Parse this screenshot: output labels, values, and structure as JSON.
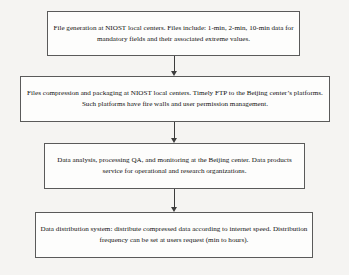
{
  "diagram": {
    "type": "flowchart",
    "orientation": "vertical",
    "colors": {
      "background": "#f5f4f2",
      "node_fill": "#fdfdfc",
      "node_border": "#5a5a5a",
      "connector": "#3c3c3c",
      "text": "#111111"
    },
    "nodes": [
      {
        "id": "file-generation",
        "text": "File generation at NIOST local centers. Files include: 1-min, 2-min, 10-min data for mandatory fields and their associated extreme values."
      },
      {
        "id": "compression-packaging",
        "text": "Files compression and packaging at NIOST local centers. Timely FTP to the Beijing center’s platforms. Such platforms have fire walls and user permission management."
      },
      {
        "id": "data-analysis",
        "text": "Data analysis, processing QA, and monitoring at the Beijing center. Data products service for operational and research organizations."
      },
      {
        "id": "data-distribution",
        "text": "Data distribution system: distribute compressed data according to internet speed. Distribution frequency can be set at users request (min to hours)."
      }
    ],
    "connectors": [
      {
        "id": "arrow-1",
        "from": "file-generation",
        "to": "compression-packaging",
        "style": "down-arrow"
      },
      {
        "id": "arrow-2",
        "from": "compression-packaging",
        "to": "data-analysis",
        "style": "down-arrow"
      },
      {
        "id": "arrow-3",
        "from": "data-analysis",
        "to": "data-distribution",
        "style": "down-arrow"
      }
    ]
  }
}
